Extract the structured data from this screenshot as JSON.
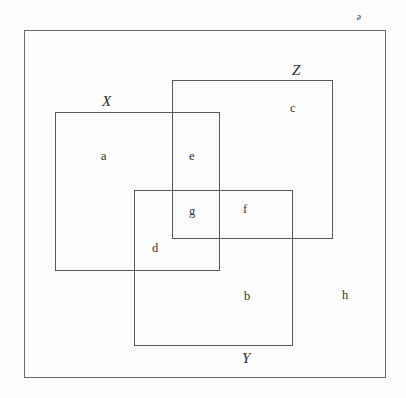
{
  "diagram": {
    "kind": "set-diagram",
    "background_color": "#fdfdfd",
    "line_color": "#585858",
    "text_color": "#2f2f2f",
    "sets": [
      {
        "name": "universe",
        "label": "ᵊ",
        "label_style": "script-italic",
        "x": 24,
        "y": 30,
        "width": 362,
        "height": 348,
        "label_x": 356,
        "label_y": 11
      },
      {
        "name": "set-x",
        "label": "X",
        "label_style": "italic",
        "x": 55,
        "y": 112,
        "width": 165,
        "height": 159,
        "label_x": 102,
        "label_y": 94
      },
      {
        "name": "set-z",
        "label": "Z",
        "label_style": "italic",
        "x": 172,
        "y": 80,
        "width": 161,
        "height": 159,
        "label_x": 292,
        "label_y": 63
      },
      {
        "name": "set-y",
        "label": "Y",
        "label_style": "italic",
        "x": 134,
        "y": 190,
        "width": 159,
        "height": 156,
        "label_x": 242,
        "label_y": 351
      }
    ],
    "regions": [
      {
        "name": "region-a",
        "label": "a",
        "x": 101,
        "y": 150
      },
      {
        "name": "region-e",
        "label": "e",
        "x": 189,
        "y": 150
      },
      {
        "name": "region-c",
        "label": "c",
        "x": 290,
        "y": 102
      },
      {
        "name": "region-g",
        "label": "g",
        "x": 189,
        "y": 205
      },
      {
        "name": "region-f",
        "label": "f",
        "x": 243,
        "y": 203
      },
      {
        "name": "region-d",
        "label": "d",
        "x": 152,
        "y": 242
      },
      {
        "name": "region-b",
        "label": "b",
        "x": 244,
        "y": 290
      },
      {
        "name": "region-h",
        "label": "h",
        "x": 342,
        "y": 289
      }
    ]
  }
}
